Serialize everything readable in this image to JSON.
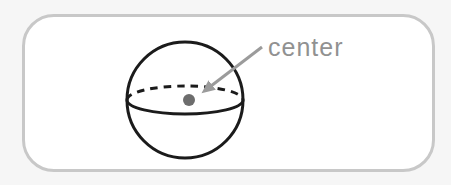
{
  "figure": {
    "label": "center",
    "colors": {
      "page_bg": "#f6f6f6",
      "card_bg": "#ffffff",
      "card_border": "#c8c8c8",
      "sphere_stroke": "#1b1b1b",
      "center_dot": "#6d6d6d",
      "arrow": "#9b9b9b",
      "label_text": "#919191"
    }
  }
}
